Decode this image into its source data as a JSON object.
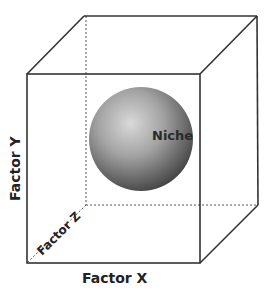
{
  "diagram": {
    "axes": {
      "x_label": "Factor X",
      "y_label": "Factor Y",
      "z_label": "Factor Z"
    },
    "sphere_label": "Niche",
    "colors": {
      "edge": "#333333",
      "hidden_edge": "#555555",
      "sphere_light": "#d8d8d8",
      "sphere_mid": "#9a9a9a",
      "sphere_dark": "#4a4a4a",
      "label": "#222222"
    }
  }
}
